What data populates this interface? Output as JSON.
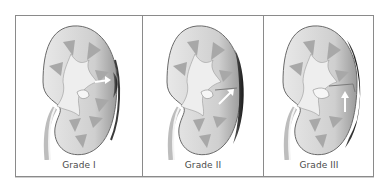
{
  "figure": {
    "panels": [
      {
        "label": "Grade I",
        "arrow_direction": "right",
        "hematoma_size": "small"
      },
      {
        "label": "Grade II",
        "arrow_direction": "up-right",
        "hematoma_size": "medium"
      },
      {
        "label": "Grade III",
        "arrow_direction": "up",
        "hematoma_size": "large"
      }
    ],
    "colors": {
      "frame_border": "#8a8a8a",
      "cortex": "#d9d9d9",
      "medulla_pyramids": "#a8a8a8",
      "pelvis": "#eeeeee",
      "capsule_dark": "#2e2e2e",
      "arrow": "#ffffff",
      "label_text": "#4a4a4a"
    }
  }
}
